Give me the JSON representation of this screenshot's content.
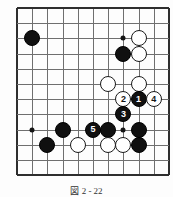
{
  "figure": {
    "caption": "図 2  -  22",
    "type": "go-board-diagram"
  },
  "board": {
    "grid": {
      "origin_x": 17,
      "origin_y": 8,
      "spacing": 15.2,
      "cols": 11,
      "rows": 12,
      "line_color": "#6f6f6f",
      "edge_color": "#2e2e2e"
    },
    "star_points": [
      {
        "col": 1,
        "row": 2
      },
      {
        "col": 7,
        "row": 2
      },
      {
        "col": 1,
        "row": 8
      },
      {
        "col": 7,
        "row": 8
      }
    ],
    "colors": {
      "black": "#101010",
      "white": "#ffffff",
      "board_bg": "#fdfdfd"
    }
  },
  "stones": [
    {
      "col": 1,
      "row": 2,
      "color": "black",
      "label": "",
      "name": "stone-black-star-upper-left"
    },
    {
      "col": 8,
      "row": 2,
      "color": "white",
      "label": "",
      "name": "stone-white-a"
    },
    {
      "col": 7,
      "row": 3,
      "color": "black",
      "label": "",
      "name": "stone-black-a"
    },
    {
      "col": 8,
      "row": 3,
      "color": "white",
      "label": "",
      "name": "stone-white-b"
    },
    {
      "col": 6,
      "row": 5,
      "color": "white",
      "label": "",
      "name": "stone-white-c"
    },
    {
      "col": 8,
      "row": 5,
      "color": "white",
      "label": "",
      "name": "stone-white-d"
    },
    {
      "col": 7,
      "row": 6,
      "color": "white",
      "label": "2",
      "name": "stone-move-2"
    },
    {
      "col": 8,
      "row": 6,
      "color": "black",
      "label": "1",
      "name": "stone-move-1"
    },
    {
      "col": 9,
      "row": 6,
      "color": "white",
      "label": "4",
      "name": "stone-move-4"
    },
    {
      "col": 7,
      "row": 7,
      "color": "black",
      "label": "3",
      "name": "stone-move-3"
    },
    {
      "col": 3,
      "row": 8,
      "color": "black",
      "label": "",
      "name": "stone-black-b"
    },
    {
      "col": 5,
      "row": 8,
      "color": "black",
      "label": "5",
      "name": "stone-move-5"
    },
    {
      "col": 6,
      "row": 8,
      "color": "black",
      "label": "",
      "name": "stone-black-c"
    },
    {
      "col": 8,
      "row": 8,
      "color": "black",
      "label": "",
      "name": "stone-black-d"
    },
    {
      "col": 2,
      "row": 9,
      "color": "black",
      "label": "",
      "name": "stone-black-e"
    },
    {
      "col": 4,
      "row": 9,
      "color": "white",
      "label": "",
      "name": "stone-white-e"
    },
    {
      "col": 6,
      "row": 9,
      "color": "white",
      "label": "",
      "name": "stone-white-f"
    },
    {
      "col": 7,
      "row": 9,
      "color": "white",
      "label": "",
      "name": "stone-white-g"
    },
    {
      "col": 8,
      "row": 9,
      "color": "black",
      "label": "",
      "name": "stone-black-f"
    }
  ]
}
